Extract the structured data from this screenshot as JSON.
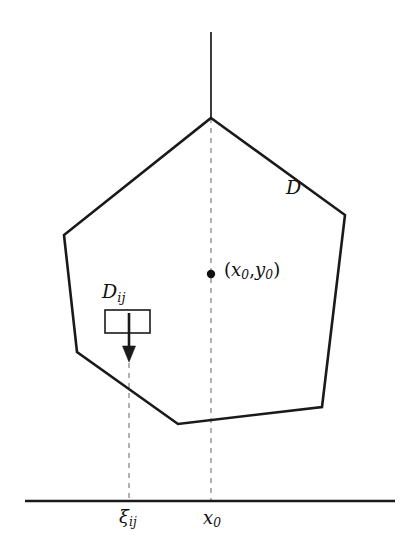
{
  "figure": {
    "background_color": "#ffffff",
    "stroke_color": "#1a1a1a",
    "dash_color": "#8a8a8a",
    "width": 417,
    "height": 559
  },
  "labels": {
    "region": {
      "name": "D",
      "text": "D",
      "x": 286,
      "y": 178
    },
    "subregion": {
      "name": "D_ij",
      "base": "D",
      "subscript": "ij",
      "x": 102,
      "y": 282
    },
    "point": {
      "name": "(x0, y0)",
      "open_paren": "(",
      "x_base": "x",
      "x_sub": "0",
      "comma": ",",
      "y_base": "y",
      "y_sub": "0",
      "close_paren": ")",
      "x": 224,
      "y": 261
    },
    "axis_xi": {
      "name": "xi_ij",
      "base": "ξ",
      "subscript": "ij",
      "x": 119,
      "y": 508
    },
    "axis_x0": {
      "name": "x_0",
      "base": "x",
      "subscript": "0",
      "x": 203,
      "y": 509
    }
  },
  "geometry": {
    "polygon": {
      "name": "region-D-outline",
      "points": [
        [
          211,
          118
        ],
        [
          345,
          215
        ],
        [
          322,
          407
        ],
        [
          178,
          424
        ],
        [
          77,
          352
        ],
        [
          64,
          235
        ]
      ],
      "stroke_width": 2.6,
      "fill": "none"
    },
    "vertical_solid_line": {
      "name": "x0-solid-line",
      "x": 211,
      "y_top": 32,
      "y_bottom": 118,
      "stroke_width": 1.7
    },
    "dashed_line_x0": {
      "name": "x0-dashed-line",
      "x": 211,
      "y_top": 118,
      "y_bottom": 501,
      "stroke_width": 1.3,
      "dash": "5 5"
    },
    "dashed_line_xi": {
      "name": "xi-dashed-line",
      "x": 129,
      "y_top": 363,
      "y_bottom": 501,
      "stroke_width": 1.3,
      "dash": "5 5"
    },
    "baseline": {
      "name": "horizontal-baseline",
      "y": 501,
      "x_left": 25,
      "x_right": 395,
      "stroke_width": 2.4
    },
    "subregion_rect": {
      "name": "Dij-rectangle",
      "x": 105,
      "y": 310,
      "width": 45,
      "height": 23,
      "stroke_width": 1.6,
      "fill": "none"
    },
    "arrow": {
      "name": "downward-arrow",
      "x": 129,
      "y_start": 313,
      "y_end": 361,
      "shaft_width": 2.6,
      "head_width": 13,
      "head_length": 15
    },
    "point_marker": {
      "name": "x0-y0-dot",
      "cx": 211,
      "cy": 274,
      "r": 4.2
    }
  }
}
